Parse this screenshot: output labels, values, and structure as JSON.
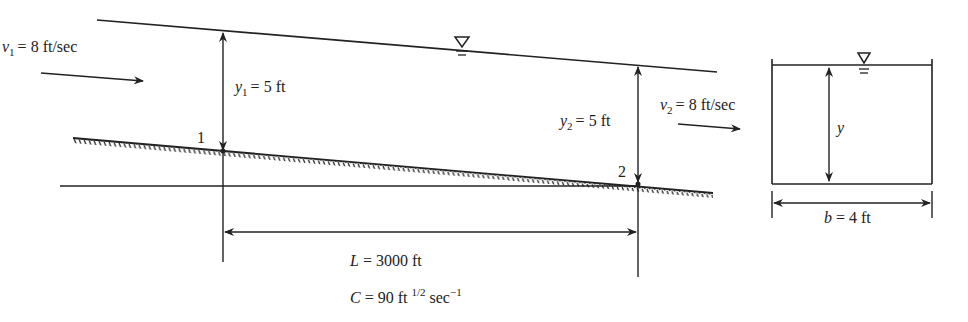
{
  "figure": {
    "type": "open-channel-flow-profile",
    "profile": {
      "section1": {
        "point_label": "1",
        "velocity": {
          "symbol": "v",
          "subscript": "1",
          "value_text": "= 8 ft/sec"
        },
        "depth": {
          "symbol": "y",
          "subscript": "1",
          "value_text": "= 5 ft"
        }
      },
      "section2": {
        "point_label": "2",
        "velocity": {
          "symbol": "v",
          "subscript": "2",
          "value_text": "= 8 ft/sec"
        },
        "depth": {
          "symbol": "y",
          "subscript": "2",
          "value_text": "= 5 ft"
        }
      },
      "length": {
        "symbol": "L",
        "value_text": "= 3000 ft"
      },
      "chezy": {
        "symbol": "C",
        "value_text": "= 90 ft",
        "exp1": "1/2",
        "unit2": "sec",
        "exp2": "−1"
      }
    },
    "cross_section": {
      "depth_symbol": "y",
      "width": {
        "symbol": "b",
        "value_text": "= 4 ft"
      }
    },
    "icons": {
      "water_surface": "free-surface-triangle-icon"
    }
  }
}
